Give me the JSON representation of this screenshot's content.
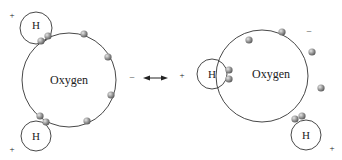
{
  "diagram": {
    "type": "water-molecule-resonance",
    "left_molecule": {
      "center_label": "Oxygen",
      "hydrogen_labels": [
        "H",
        "H"
      ],
      "charges": {
        "top_left": "+",
        "bottom_left": "+",
        "right": "–"
      }
    },
    "arrow": "double-headed",
    "right_molecule": {
      "center_label": "Oxygen",
      "hydrogen_labels": [
        "H",
        "H"
      ],
      "charges": {
        "left": "+",
        "bottom_right": "+",
        "top_right": "–"
      }
    },
    "colors": {
      "line": "#333333",
      "electron": "#8a8a8a",
      "electron_highlight": "#d8d8d8"
    }
  }
}
